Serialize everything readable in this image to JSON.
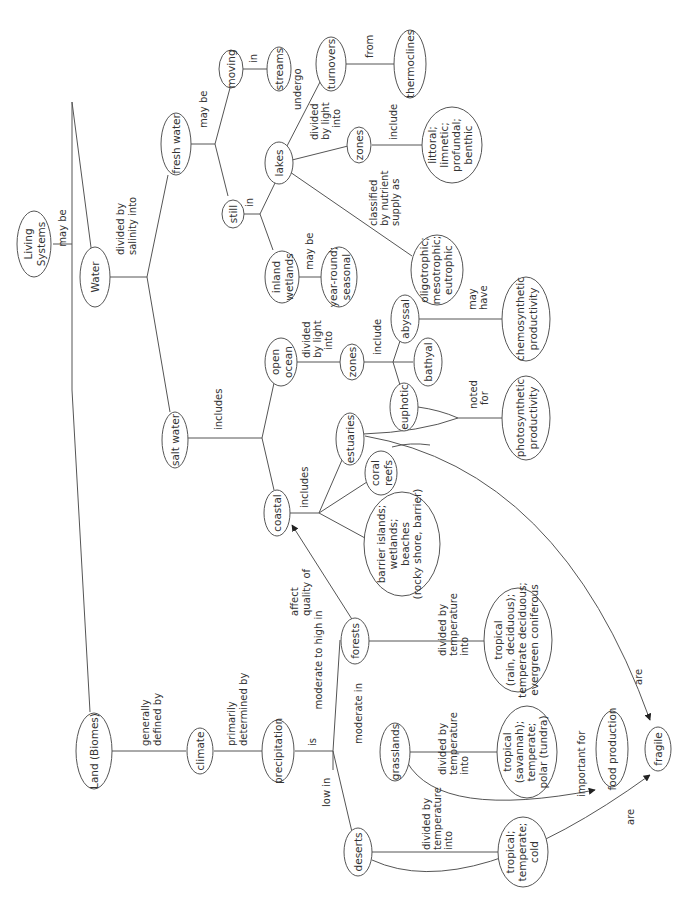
{
  "nodes": {
    "living_systems": [
      "Living",
      "Systems"
    ],
    "water": [
      "Water"
    ],
    "land": [
      "Land (Biomes)"
    ],
    "fresh_water": [
      "fresh water"
    ],
    "salt_water": [
      "salt water"
    ],
    "moving": [
      "moving"
    ],
    "streams": [
      "streams"
    ],
    "still": [
      "still"
    ],
    "lakes": [
      "lakes"
    ],
    "inland_wetlands": [
      "inland",
      "wetlands"
    ],
    "year_round": [
      "year-round;",
      "seasonal"
    ],
    "turnovers": [
      "turnovers"
    ],
    "thermoclines": [
      "thermoclines"
    ],
    "lake_zones": [
      "zones"
    ],
    "lake_zone_list": [
      "littoral;",
      "limnetic;",
      "profundal;",
      "benthic"
    ],
    "trophic": [
      "oligotrophic;",
      "mesotrophic;",
      "eutrophic"
    ],
    "open_ocean": [
      "open",
      "ocean"
    ],
    "ocean_zones": [
      "zones"
    ],
    "abyssal": [
      "abyssal"
    ],
    "bathyal": [
      "bathyal"
    ],
    "euphotic": [
      "euphotic"
    ],
    "chemosynthetic": [
      "chemosynthetic",
      "productivity"
    ],
    "photosynthetic": [
      "photosynthetic",
      "productivity"
    ],
    "coastal": [
      "coastal"
    ],
    "estuaries": [
      "estuaries"
    ],
    "coral_reefs": [
      "coral",
      "reefs"
    ],
    "barrier": [
      "barrier islands;",
      "wetlands;",
      "beaches",
      "(rocky shore, barrier)"
    ],
    "climate": [
      "climate"
    ],
    "precipitation": [
      "precipitation"
    ],
    "forests": [
      "forests"
    ],
    "grasslands": [
      "grasslands"
    ],
    "deserts": [
      "deserts"
    ],
    "forest_types": [
      "tropical",
      "(rain, deciduous);",
      "temperate deciduous;",
      "evergreen coniferous"
    ],
    "grassland_types": [
      "tropical",
      "(savannah);",
      "temperate;",
      "polar (tundra)"
    ],
    "desert_types": [
      "tropical;",
      "temperate;",
      "cold"
    ],
    "food_production": [
      "food production"
    ],
    "fragile": [
      "fragile"
    ]
  },
  "links": {
    "may_be_top": [
      "may be"
    ],
    "divided_salinity": [
      "divided by",
      "salinity into"
    ],
    "fresh_may_be": [
      "may be"
    ],
    "moving_in": [
      "in"
    ],
    "still_in": [
      "in"
    ],
    "undergo": [
      "undergo"
    ],
    "from": [
      "from"
    ],
    "lake_divided_light": [
      "divided",
      "by light",
      "into"
    ],
    "lake_include": [
      "include"
    ],
    "classified": [
      "classified",
      "by nutrient",
      "supply as"
    ],
    "wetlands_may_be": [
      "may be"
    ],
    "salt_includes": [
      "includes"
    ],
    "ocean_divided_light": [
      "divided",
      "by light",
      "into"
    ],
    "ocean_include": [
      "include"
    ],
    "may_have": [
      "may",
      "have"
    ],
    "noted_for": [
      "noted",
      "for"
    ],
    "coastal_includes": [
      "includes"
    ],
    "generally_defined": [
      "generally",
      "defined by"
    ],
    "primarily_determined": [
      "primarily",
      "determined by"
    ],
    "is": [
      "is"
    ],
    "moderate_high": [
      "moderate to high in"
    ],
    "moderate_in": [
      "moderate in"
    ],
    "low_in": [
      "low in"
    ],
    "affect_quality": [
      "affect",
      "quality of"
    ],
    "forest_divided_temp": [
      "divided by",
      "temperature",
      "into"
    ],
    "grass_divided_temp": [
      "divided by",
      "temperature",
      "into"
    ],
    "desert_divided_temp": [
      "divided by",
      "temperature",
      "into"
    ],
    "important_for": [
      "important for"
    ],
    "are_top": [
      "are"
    ],
    "are_bottom": [
      "are"
    ]
  }
}
